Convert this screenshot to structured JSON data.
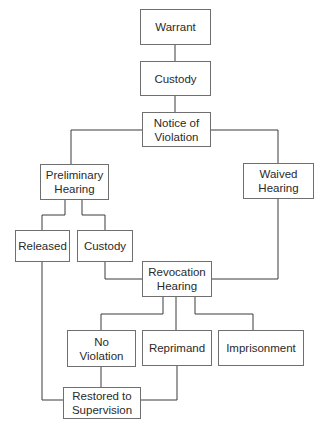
{
  "diagram": {
    "type": "flowchart",
    "nodes": [
      {
        "id": "warrant",
        "label": "Warrant"
      },
      {
        "id": "custody1",
        "label": "Custody"
      },
      {
        "id": "notice",
        "label": "Notice of\nViolation"
      },
      {
        "id": "preliminary",
        "label": "Preliminary\nHearing"
      },
      {
        "id": "waived",
        "label": "Waived\nHearing"
      },
      {
        "id": "released",
        "label": "Released"
      },
      {
        "id": "custody2",
        "label": "Custody"
      },
      {
        "id": "revocation",
        "label": "Revocation\nHearing"
      },
      {
        "id": "noviolation",
        "label": "No\nViolation"
      },
      {
        "id": "reprimand",
        "label": "Reprimand"
      },
      {
        "id": "imprisonment",
        "label": "Imprisonment"
      },
      {
        "id": "restored",
        "label": "Restored to\nSupervision"
      }
    ],
    "edges": [
      [
        "warrant",
        "custody1"
      ],
      [
        "custody1",
        "notice"
      ],
      [
        "notice",
        "preliminary"
      ],
      [
        "notice",
        "waived"
      ],
      [
        "preliminary",
        "released"
      ],
      [
        "preliminary",
        "custody2"
      ],
      [
        "custody2",
        "revocation"
      ],
      [
        "waived",
        "revocation"
      ],
      [
        "revocation",
        "noviolation"
      ],
      [
        "revocation",
        "reprimand"
      ],
      [
        "revocation",
        "imprisonment"
      ],
      [
        "noviolation",
        "restored"
      ],
      [
        "reprimand",
        "restored"
      ],
      [
        "released",
        "restored"
      ]
    ],
    "colors": {
      "line": "#3a3a3a",
      "border": "#6f6f6f",
      "text": "#2a2a2a"
    }
  }
}
